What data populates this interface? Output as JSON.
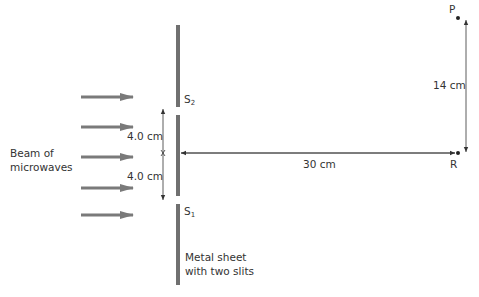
{
  "diagram": {
    "beam_label_line1": "Beam of",
    "beam_label_line2": "microwaves",
    "sheet_label_line1": "Metal sheet",
    "sheet_label_line2": "with two slits",
    "slit_top": {
      "letter": "S",
      "subscript": "2"
    },
    "slit_bottom": {
      "letter": "S",
      "subscript": "1"
    },
    "dim_upper": "4.0 cm",
    "dim_lower": "4.0 cm",
    "dim_horizontal": "30 cm",
    "dim_vertical": "14 cm",
    "point_p": "P",
    "point_r": "R",
    "arrow_count": 5,
    "colors": {
      "sheet": "#707070",
      "arrow": "#7a7a7a",
      "line": "#333333",
      "text": "#333333"
    }
  }
}
